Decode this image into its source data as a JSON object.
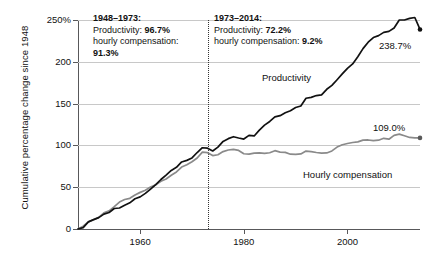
{
  "chart_data": {
    "type": "line",
    "title": "",
    "subtitle": "",
    "xlabel": "",
    "ylabel": "Cumulative percentage change since 1948",
    "xlim": [
      1948,
      2014
    ],
    "ylim": [
      0,
      250
    ],
    "grid": true,
    "legend_position": "inline-annotations",
    "y_ticks": [
      "250%",
      "200",
      "150",
      "100",
      "50",
      "0"
    ],
    "y_tick_values": [
      250,
      200,
      150,
      100,
      50,
      0
    ],
    "x_ticks": [
      "1960",
      "1980",
      "2000"
    ],
    "x_tick_values": [
      1960,
      1980,
      2000
    ],
    "divider_year": 1973,
    "series": [
      {
        "name": "Productivity",
        "color": "#111111",
        "end_label": "238.7%",
        "end_value": 238.7,
        "x": [
          1948,
          1949,
          1950,
          1951,
          1952,
          1953,
          1954,
          1955,
          1956,
          1957,
          1958,
          1959,
          1960,
          1961,
          1962,
          1963,
          1964,
          1965,
          1966,
          1967,
          1968,
          1969,
          1970,
          1971,
          1972,
          1973,
          1974,
          1975,
          1976,
          1977,
          1978,
          1979,
          1980,
          1981,
          1982,
          1983,
          1984,
          1985,
          1986,
          1987,
          1988,
          1989,
          1990,
          1991,
          1992,
          1993,
          1994,
          1995,
          1996,
          1997,
          1998,
          1999,
          2000,
          2001,
          2002,
          2003,
          2004,
          2005,
          2006,
          2007,
          2008,
          2009,
          2010,
          2011,
          2012,
          2013,
          2014
        ],
        "values": [
          0,
          1.6,
          8.5,
          11.2,
          13.6,
          17.8,
          19.8,
          24.5,
          25.1,
          28.4,
          31.3,
          36.2,
          38.4,
          42.6,
          47.8,
          53.1,
          59.2,
          64.5,
          70.1,
          73.8,
          80.2,
          82.1,
          85.0,
          91.5,
          97.2,
          96.7,
          93.3,
          97.9,
          104.8,
          108.1,
          110.4,
          108.8,
          107.6,
          112.0,
          111.3,
          118.2,
          124.2,
          128.6,
          134.2,
          135.6,
          139.0,
          141.5,
          145.3,
          147.1,
          156.4,
          157.5,
          159.6,
          160.4,
          167.1,
          171.8,
          178.5,
          185.5,
          192.2,
          197.5,
          206.1,
          215.8,
          223.4,
          229.0,
          231.3,
          235.2,
          236.4,
          240.5,
          250.0,
          250.0,
          252.0,
          253.0,
          238.7
        ]
      },
      {
        "name": "Hourly compensation",
        "color": "#8a8a8a",
        "end_label": "109.0%",
        "end_value": 109.0,
        "x": [
          1948,
          1949,
          1950,
          1951,
          1952,
          1953,
          1954,
          1955,
          1956,
          1957,
          1958,
          1959,
          1960,
          1961,
          1962,
          1963,
          1964,
          1965,
          1966,
          1967,
          1968,
          1969,
          1970,
          1971,
          1972,
          1973,
          1974,
          1975,
          1976,
          1977,
          1978,
          1979,
          1980,
          1981,
          1982,
          1983,
          1984,
          1985,
          1986,
          1987,
          1988,
          1989,
          1990,
          1991,
          1992,
          1993,
          1994,
          1995,
          1996,
          1997,
          1998,
          1999,
          2000,
          2001,
          2002,
          2003,
          2004,
          2005,
          2006,
          2007,
          2008,
          2009,
          2010,
          2011,
          2012,
          2013,
          2014
        ],
        "values": [
          0,
          3.3,
          8.5,
          11.0,
          13.9,
          19.3,
          21.7,
          26.8,
          32.2,
          35.3,
          36.7,
          40.7,
          43.8,
          46.3,
          50.2,
          52.8,
          57.0,
          59.8,
          64.3,
          68.2,
          74.1,
          76.8,
          80.5,
          85.0,
          92.0,
          91.3,
          87.8,
          88.8,
          92.6,
          94.5,
          95.2,
          94.0,
          90.0,
          89.6,
          90.8,
          91.1,
          90.5,
          91.2,
          93.7,
          92.0,
          91.6,
          89.5,
          89.3,
          89.8,
          93.2,
          92.5,
          91.5,
          90.8,
          91.0,
          93.4,
          98.0,
          100.8,
          102.3,
          103.5,
          104.2,
          106.3,
          106.5,
          105.8,
          106.2,
          108.5,
          107.4,
          112.0,
          113.5,
          111.5,
          109.5,
          109.0,
          109.0
        ]
      }
    ],
    "annotations": [
      {
        "id": "period-1",
        "heading": "1948–1973:",
        "lines": [
          {
            "label": "Productivity: ",
            "value": "96.7%"
          },
          {
            "label": "hourly compensation: ",
            "value": ""
          },
          {
            "label": "",
            "value": "91.3%"
          }
        ]
      },
      {
        "id": "period-2",
        "heading": "1973–2014:",
        "lines": [
          {
            "label": "Productivity: ",
            "value": "72.2%"
          },
          {
            "label": "hourly compensation: ",
            "value": "9.2%"
          }
        ]
      }
    ]
  },
  "axis": {
    "ylabel": "Cumulative percentage change since 1948",
    "y_ticks": [
      "250%",
      "200",
      "150",
      "100",
      "50",
      "0"
    ],
    "x_ticks": [
      "1960",
      "1980",
      "2000"
    ]
  },
  "annotation1": {
    "heading": "1948–1973:",
    "line1_label": "Productivity: ",
    "line1_value": "96.7%",
    "line2_label": "hourly compensation:",
    "line3_value": "91.3%"
  },
  "annotation2": {
    "heading": "1973–2014:",
    "line1_label": "Productivity: ",
    "line1_value": "72.2%",
    "line2_label": "hourly compensation: ",
    "line2_value": "9.2%"
  },
  "labels": {
    "productivity": "Productivity",
    "hourly_compensation": "Hourly compensation",
    "productivity_end": "238.7%",
    "hourly_end": "109.0%"
  }
}
